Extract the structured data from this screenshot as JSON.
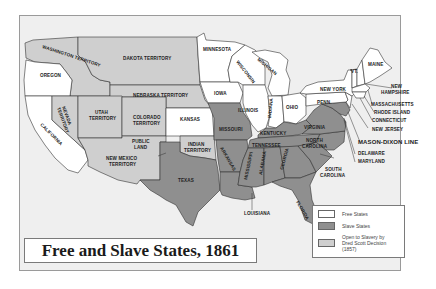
{
  "title": "Free and Slave States, 1861",
  "colors": {
    "free": "#ffffff",
    "slave": "#8f8f8f",
    "open": "#cfcfcf",
    "water": "#efefef",
    "border": "#333333"
  },
  "legend": {
    "items": [
      {
        "label": "Free States",
        "color": "#ffffff"
      },
      {
        "label": "Slave States",
        "color": "#8f8f8f"
      },
      {
        "label": "Open to Slavery by",
        "label2": "Dred Scott Decision (1857)",
        "color": "#cfcfcf"
      }
    ]
  },
  "labels": {
    "washington": "WASHINGTON TERRITORY",
    "oregon": "OREGON",
    "california": "CALIFORNIA",
    "nevada": "NEVADA",
    "nevada2": "TERRITORY",
    "utah": "UTAH",
    "utah2": "TERRITORY",
    "colorado": "COLORADO",
    "colorado2": "TERRITORY",
    "dakota": "DAKOTA TERRITORY",
    "nebraska": "NEBRASKA TERRITORY",
    "kansas": "KANSAS",
    "public": "PUBLIC",
    "public2": "LAND",
    "newmexico": "NEW MEXICO",
    "newmexico2": "TERRITORY",
    "indian": "INDIAN",
    "indian2": "TERRITORY",
    "texas": "TEXAS",
    "minnesota": "MINNESOTA",
    "iowa": "IOWA",
    "missouri": "MISSOURI",
    "arkansas": "ARKANSAS",
    "louisiana": "LOUISIANA",
    "wisconsin": "WISCONSIN",
    "michigan": "MICHIGAN",
    "illinois": "ILLINOIS",
    "indiana": "INDIANA",
    "ohio": "OHIO",
    "kentucky": "KENTUCKY",
    "tennessee": "TENNESSEE",
    "mississippi": "MISSISSIPPI",
    "alabama": "ALABAMA",
    "georgia": "GEORGIA",
    "florida": "FLORIDA",
    "southcarolina": "SOUTH",
    "southcarolina2": "CAROLINA",
    "northcarolina": "NORTH",
    "northcarolina2": "CAROLINA",
    "virginia": "VIRGINIA",
    "penn": "PENN.",
    "newyork": "NEW YORK",
    "vt": "VT.",
    "maine": "MAINE",
    "newhampshire": "NEW",
    "newhampshire2": "HAMPSHIRE",
    "massachusetts": "MASSACHUSETTS",
    "rhodeisland": "RHODE ISLAND",
    "connecticut": "CONNECTICUT",
    "newjersey": "NEW JERSEY",
    "masondixon": "MASON-DIXON LINE",
    "delaware": "DELAWARE",
    "maryland": "MARYLAND"
  }
}
